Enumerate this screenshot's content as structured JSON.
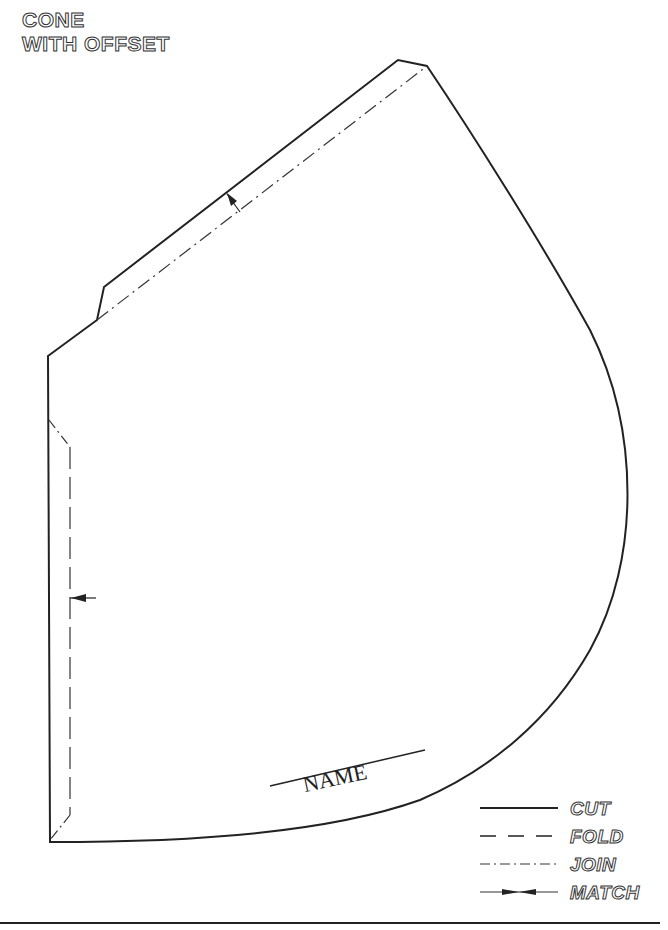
{
  "title": {
    "line1": "CONE",
    "line2": "WITH OFFSET"
  },
  "pattern_piece": {
    "label": "NAME",
    "outline_color": "#222222",
    "line_width": 2
  },
  "legend": {
    "items": [
      {
        "style": "solid",
        "label": "CUT"
      },
      {
        "style": "dashed",
        "label": "FOLD"
      },
      {
        "style": "dash-dot",
        "label": "JOIN"
      },
      {
        "style": "match-arrows",
        "label": "MATCH"
      }
    ]
  }
}
